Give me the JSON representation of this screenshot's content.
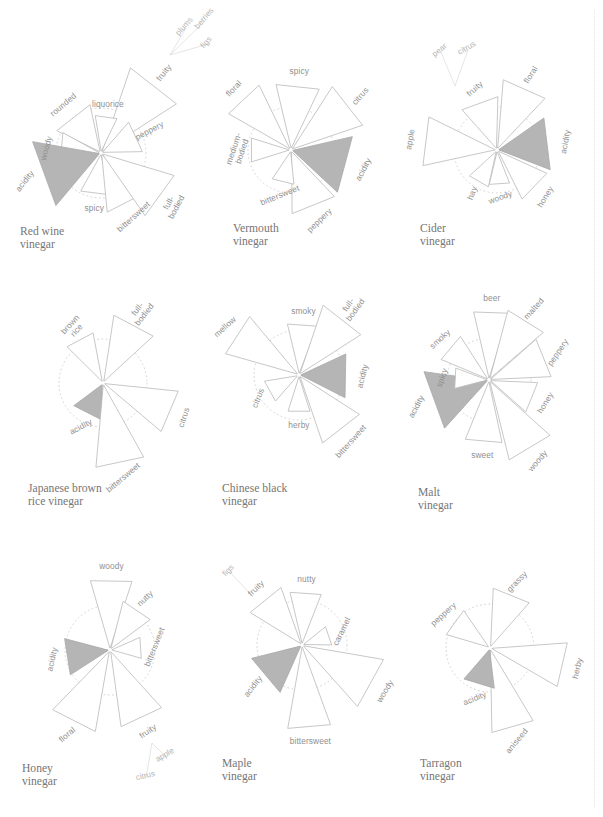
{
  "figure": {
    "kind": "small-multiples-petal-charts",
    "panel_count": 9,
    "columns": 3,
    "rows": 3,
    "background": "#ffffff",
    "outline_color": "#b9b9b9",
    "accent_fill": "#b5b5b5",
    "ring_color": "#cfcfcf",
    "label_color": "#8f8f8f",
    "title_color": "#767676"
  },
  "chart_data": {
    "type": "radar",
    "value_range": [
      0,
      100
    ],
    "reference_ring": 50,
    "grid": "dotted-circle",
    "legend": "none",
    "accent_category": "acidity",
    "charts": [
      {
        "id": "red-wine-vinegar",
        "title": "Red wine\nvinegar",
        "center": [
          101,
          153
        ],
        "ring_radius": 45,
        "petals": [
          {
            "label": "fruity",
            "angle": -52,
            "value": 100,
            "width": 9,
            "accent": false,
            "label_rotate": -52
          },
          {
            "label": "peppery",
            "angle": -25,
            "value": 46,
            "width": 11,
            "accent": false,
            "label_rotate": -28
          },
          {
            "label": "liquorice",
            "angle": -82,
            "value": 42,
            "width": 8,
            "accent": false,
            "label_rotate": 0
          },
          {
            "label": "rounded",
            "angle": -128,
            "value": 55,
            "width": 12,
            "accent": false,
            "label_rotate": -40
          },
          {
            "label": "woody",
            "angle": -175,
            "value": 48,
            "width": 11,
            "accent": false,
            "label_rotate": -75
          },
          {
            "label": "acidity",
            "angle": 160,
            "value": 77,
            "width": 14,
            "accent": true,
            "label_rotate": -52
          },
          {
            "label": "spicy",
            "angle": 97,
            "value": 48,
            "width": 10,
            "accent": false,
            "label_rotate": 0
          },
          {
            "label": "bittersweet",
            "angle": 63,
            "value": 66,
            "width": 10,
            "accent": false,
            "label_rotate": -42
          },
          {
            "label": "full-\nbodied",
            "angle": 36,
            "value": 85,
            "width": 9,
            "accent": false,
            "label_rotate": -62
          }
        ],
        "sub_labels": [
          {
            "text": "plums",
            "from": [
              170,
              55
            ],
            "to": [
              186,
              28
            ],
            "rotate": -48
          },
          {
            "text": "berries",
            "from": [
              170,
              55
            ],
            "to": [
              206,
              20
            ],
            "rotate": -50
          },
          {
            "text": "figs",
            "from": [
              170,
              55
            ],
            "to": [
              208,
              44
            ],
            "rotate": -48
          }
        ]
      },
      {
        "id": "vermouth-vinegar",
        "title": "Vermouth\nvinegar",
        "center": [
          291,
          150
        ],
        "ring_radius": 43,
        "petals": [
          {
            "label": "spicy",
            "angle": -84,
            "value": 78,
            "width": 9,
            "accent": false,
            "label_rotate": 0
          },
          {
            "label": "citrus",
            "angle": -38,
            "value": 88,
            "width": 9,
            "accent": false,
            "label_rotate": -48
          },
          {
            "label": "acidity",
            "angle": 15,
            "value": 73,
            "width": 13,
            "accent": true,
            "label_rotate": -62
          },
          {
            "label": "peppery",
            "angle": 68,
            "value": 74,
            "width": 10,
            "accent": false,
            "label_rotate": -44
          },
          {
            "label": "bittersweet",
            "angle": 104,
            "value": 40,
            "width": 9,
            "accent": false,
            "label_rotate": -22
          },
          {
            "label": "medium-\nbodied",
            "angle": 180,
            "value": 48,
            "width": 8,
            "accent": false,
            "label_rotate": -72
          },
          {
            "label": "floral",
            "angle": -133,
            "value": 84,
            "width": 8,
            "accent": false,
            "label_rotate": -46
          }
        ],
        "sub_labels": []
      },
      {
        "id": "cider-vinegar",
        "title": "Cider\nvinegar",
        "center": [
          497,
          150
        ],
        "ring_radius": 43,
        "petals": [
          {
            "label": "floral",
            "angle": -66,
            "value": 82,
            "width": 9,
            "accent": false,
            "label_rotate": -58
          },
          {
            "label": "acidity",
            "angle": -7,
            "value": 66,
            "width": 13,
            "accent": true,
            "label_rotate": -80
          },
          {
            "label": "honey",
            "angle": 44,
            "value": 64,
            "width": 9,
            "accent": false,
            "label_rotate": -58
          },
          {
            "label": "woody",
            "angle": 86,
            "value": 41,
            "width": 8,
            "accent": false,
            "label_rotate": -20
          },
          {
            "label": "hay",
            "angle": 120,
            "value": 44,
            "width": 8,
            "accent": false,
            "label_rotate": -68
          },
          {
            "label": "apple",
            "angle": 187,
            "value": 88,
            "width": 9,
            "accent": false,
            "label_rotate": -80
          },
          {
            "label": "fruity",
            "angle": -110,
            "value": 62,
            "width": 10,
            "accent": false,
            "label_rotate": -42
          }
        ],
        "sub_labels": [
          {
            "text": "pear",
            "from": [
              455,
              86
            ],
            "to": [
              441,
              52
            ],
            "rotate": -40
          },
          {
            "text": "citrus",
            "from": [
              455,
              86
            ],
            "to": [
              468,
              50
            ],
            "rotate": -30
          }
        ]
      },
      {
        "id": "japanese-brown-rice-vinegar",
        "title": "Japanese brown\nrice vinegar",
        "center": [
          103,
          383
        ],
        "ring_radius": 44,
        "petals": [
          {
            "label": "full-\nbodied",
            "angle": -62,
            "value": 78,
            "width": 9,
            "accent": false,
            "label_rotate": -52
          },
          {
            "label": "brown\nrice",
            "angle": -118,
            "value": 58,
            "width": 8,
            "accent": false,
            "label_rotate": -48
          },
          {
            "label": "acidity",
            "angle": 117,
            "value": 42,
            "width": 12,
            "accent": true,
            "label_rotate": -28
          },
          {
            "label": "bittersweet",
            "angle": 78,
            "value": 96,
            "width": 8,
            "accent": false,
            "label_rotate": -40
          },
          {
            "label": "citrus",
            "angle": 23,
            "value": 86,
            "width": 8,
            "accent": false,
            "label_rotate": -72
          }
        ],
        "sub_labels": []
      },
      {
        "id": "chinese-black-vinegar",
        "title": "Chinese black\nvinegar",
        "center": [
          299,
          375
        ],
        "ring_radius": 45,
        "petals": [
          {
            "label": "smoky",
            "angle": -86,
            "value": 58,
            "width": 8,
            "accent": false,
            "label_rotate": 0
          },
          {
            "label": "full-\nbodied",
            "angle": -52,
            "value": 82,
            "width": 9,
            "accent": false,
            "label_rotate": -54
          },
          {
            "label": "acidity",
            "angle": 1,
            "value": 57,
            "width": 12,
            "accent": true,
            "label_rotate": -76
          },
          {
            "label": "bittersweet",
            "angle": 52,
            "value": 80,
            "width": 9,
            "accent": false,
            "label_rotate": -48
          },
          {
            "label": "herby",
            "angle": 90,
            "value": 42,
            "width": 8,
            "accent": false,
            "label_rotate": 0
          },
          {
            "label": "citrus",
            "angle": 151,
            "value": 39,
            "width": 9,
            "accent": false,
            "label_rotate": -68
          },
          {
            "label": "mellow",
            "angle": -147,
            "value": 85,
            "width": 8,
            "accent": false,
            "label_rotate": -42
          }
        ],
        "sub_labels": []
      },
      {
        "id": "malt-vinegar",
        "title": "Malt\nvinegar",
        "center": [
          489,
          380
        ],
        "ring_radius": 42,
        "petals": [
          {
            "label": "beer",
            "angle": -88,
            "value": 83,
            "width": 7,
            "accent": false,
            "label_rotate": 0
          },
          {
            "label": "malted",
            "angle": -58,
            "value": 86,
            "width": 8,
            "accent": false,
            "label_rotate": -48
          },
          {
            "label": "peppery",
            "angle": -22,
            "value": 74,
            "width": 9,
            "accent": false,
            "label_rotate": -56
          },
          {
            "label": "honey",
            "angle": 22,
            "value": 58,
            "width": 9,
            "accent": false,
            "label_rotate": -58
          },
          {
            "label": "woody",
            "angle": 59,
            "value": 98,
            "width": 8,
            "accent": false,
            "label_rotate": -50
          },
          {
            "label": "sweet",
            "angle": 95,
            "value": 76,
            "width": 8,
            "accent": false,
            "label_rotate": 0
          },
          {
            "label": "acidity",
            "angle": 160,
            "value": 78,
            "width": 13,
            "accent": true,
            "label_rotate": -62
          },
          {
            "label": "spicy",
            "angle": 183,
            "value": 42,
            "width": 8,
            "accent": false,
            "label_rotate": -70
          },
          {
            "label": "smoky",
            "angle": -140,
            "value": 62,
            "width": 8,
            "accent": false,
            "label_rotate": -42
          }
        ],
        "sub_labels": []
      },
      {
        "id": "honey-vinegar",
        "title": "Honey\nvinegar",
        "center": [
          110,
          650
        ],
        "ring_radius": 45,
        "petals": [
          {
            "label": "woody",
            "angle": -89,
            "value": 80,
            "width": 8,
            "accent": false,
            "label_rotate": 0
          },
          {
            "label": "nutty",
            "angle": -56,
            "value": 56,
            "width": 9,
            "accent": false,
            "label_rotate": -44
          },
          {
            "label": "bittersweet",
            "angle": -4,
            "value": 36,
            "width": 9,
            "accent": false,
            "label_rotate": -68
          },
          {
            "label": "fruity",
            "angle": 65,
            "value": 86,
            "width": 8,
            "accent": false,
            "label_rotate": -34
          },
          {
            "label": "floral",
            "angle": 117,
            "value": 92,
            "width": 8,
            "accent": false,
            "label_rotate": -40
          },
          {
            "label": "acidity",
            "angle": 171,
            "value": 52,
            "width": 11,
            "accent": true,
            "label_rotate": -78
          }
        ],
        "sub_labels": [
          {
            "text": "apple",
            "from": [
              152,
              743
            ],
            "to": [
              166,
              757
            ],
            "rotate": -30
          },
          {
            "text": "citrus",
            "from": [
              152,
              743
            ],
            "to": [
              146,
              778
            ],
            "rotate": -14
          }
        ]
      },
      {
        "id": "maple-vinegar",
        "title": "Maple\nvinegar",
        "center": [
          302,
          645
        ],
        "ring_radius": 45,
        "petals": [
          {
            "label": "nutty",
            "angle": -86,
            "value": 60,
            "width": 8,
            "accent": false,
            "label_rotate": 0
          },
          {
            "label": "caramel",
            "angle": -19,
            "value": 33,
            "width": 9,
            "accent": false,
            "label_rotate": -64
          },
          {
            "label": "woody",
            "angle": 29,
            "value": 92,
            "width": 9,
            "accent": false,
            "label_rotate": -58
          },
          {
            "label": "bittersweet",
            "angle": 85,
            "value": 94,
            "width": 7,
            "accent": false,
            "label_rotate": 0
          },
          {
            "label": "acidity",
            "angle": 140,
            "value": 58,
            "width": 12,
            "accent": true,
            "label_rotate": -52
          },
          {
            "label": "fruity",
            "angle": -129,
            "value": 68,
            "width": 9,
            "accent": false,
            "label_rotate": -44
          }
        ],
        "sub_labels": [
          {
            "text": "figs",
            "from": [
              253,
              597
            ],
            "to": [
              230,
              572
            ],
            "rotate": -46
          }
        ]
      },
      {
        "id": "tarragon-vinegar",
        "title": "Tarragon\nvinegar",
        "center": [
          490,
          648
        ],
        "ring_radius": 44,
        "petals": [
          {
            "label": "grassy",
            "angle": -68,
            "value": 68,
            "width": 9,
            "accent": false,
            "label_rotate": -46
          },
          {
            "label": "herby",
            "angle": 13,
            "value": 88,
            "width": 8,
            "accent": false,
            "label_rotate": -76
          },
          {
            "label": "aniseed",
            "angle": 74,
            "value": 96,
            "width": 7,
            "accent": false,
            "label_rotate": -50
          },
          {
            "label": "acidity",
            "angle": 107,
            "value": 46,
            "width": 11,
            "accent": true,
            "label_rotate": -22
          },
          {
            "label": "peppery",
            "angle": -144,
            "value": 52,
            "width": 9,
            "accent": false,
            "label_rotate": -42
          }
        ],
        "sub_labels": []
      }
    ]
  }
}
